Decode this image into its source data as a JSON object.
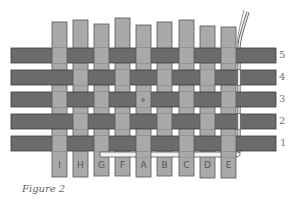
{
  "figure": {
    "caption": "Figure 2",
    "colors": {
      "horizontal_strip": "#6b6b6b",
      "vertical_strip": "#a9a9a9",
      "outline": "#3a3a3a",
      "background": "#ffffff",
      "thin_strand": "#e8e8e8"
    },
    "rows": [
      {
        "label": "5",
        "y": 48
      },
      {
        "label": "4",
        "y": 70
      },
      {
        "label": "3",
        "y": 92
      },
      {
        "label": "2",
        "y": 114
      },
      {
        "label": "1",
        "y": 136
      }
    ],
    "columns": [
      {
        "label": "I",
        "x": 52
      },
      {
        "label": "H",
        "x": 73
      },
      {
        "label": "G",
        "x": 94
      },
      {
        "label": "F",
        "x": 115
      },
      {
        "label": "A",
        "x": 136
      },
      {
        "label": "B",
        "x": 157
      },
      {
        "label": "C",
        "x": 179
      },
      {
        "label": "D",
        "x": 200
      },
      {
        "label": "E",
        "x": 221
      }
    ],
    "center_marker": "•"
  }
}
